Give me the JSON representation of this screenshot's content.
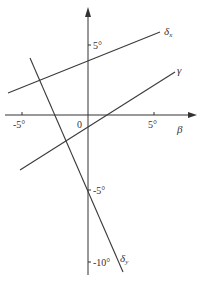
{
  "diagram": {
    "title": "",
    "colors": {
      "line": "#3a3a3a",
      "axis": "#333333",
      "text": "#333333",
      "background": "#ffffff"
    },
    "axes": {
      "x": {
        "label": "β",
        "tick_labels": [
          "-5°",
          "0",
          "5°"
        ]
      },
      "y": {
        "tick_labels": [
          "5°",
          "-5°",
          "-10°"
        ]
      }
    },
    "lines": [
      {
        "name": "δx",
        "label_main": "δ",
        "label_sub": "x",
        "from_deg": [
          -6.5,
          2.8
        ],
        "to_deg": [
          5.3,
          6.2
        ]
      },
      {
        "name": "γ",
        "label_main": "γ",
        "label_sub": "",
        "from_deg": [
          -5.2,
          -3.9
        ],
        "to_deg": [
          6.6,
          3.0
        ]
      },
      {
        "name": "δy",
        "label_main": "δ",
        "label_sub": "y",
        "from_deg": [
          -4.4,
          4.4
        ],
        "to_deg": [
          2.7,
          -10.9
        ]
      }
    ],
    "labels": {
      "x_axis": "β",
      "origin": "0",
      "x_tick_neg5": "-5°",
      "x_tick_pos5": "5°",
      "y_tick_pos5": "5°",
      "y_tick_neg5": "-5°",
      "y_tick_neg10": "-10°",
      "delta": "δ",
      "sub_x": "x",
      "sub_y": "y",
      "gamma": "γ"
    }
  }
}
